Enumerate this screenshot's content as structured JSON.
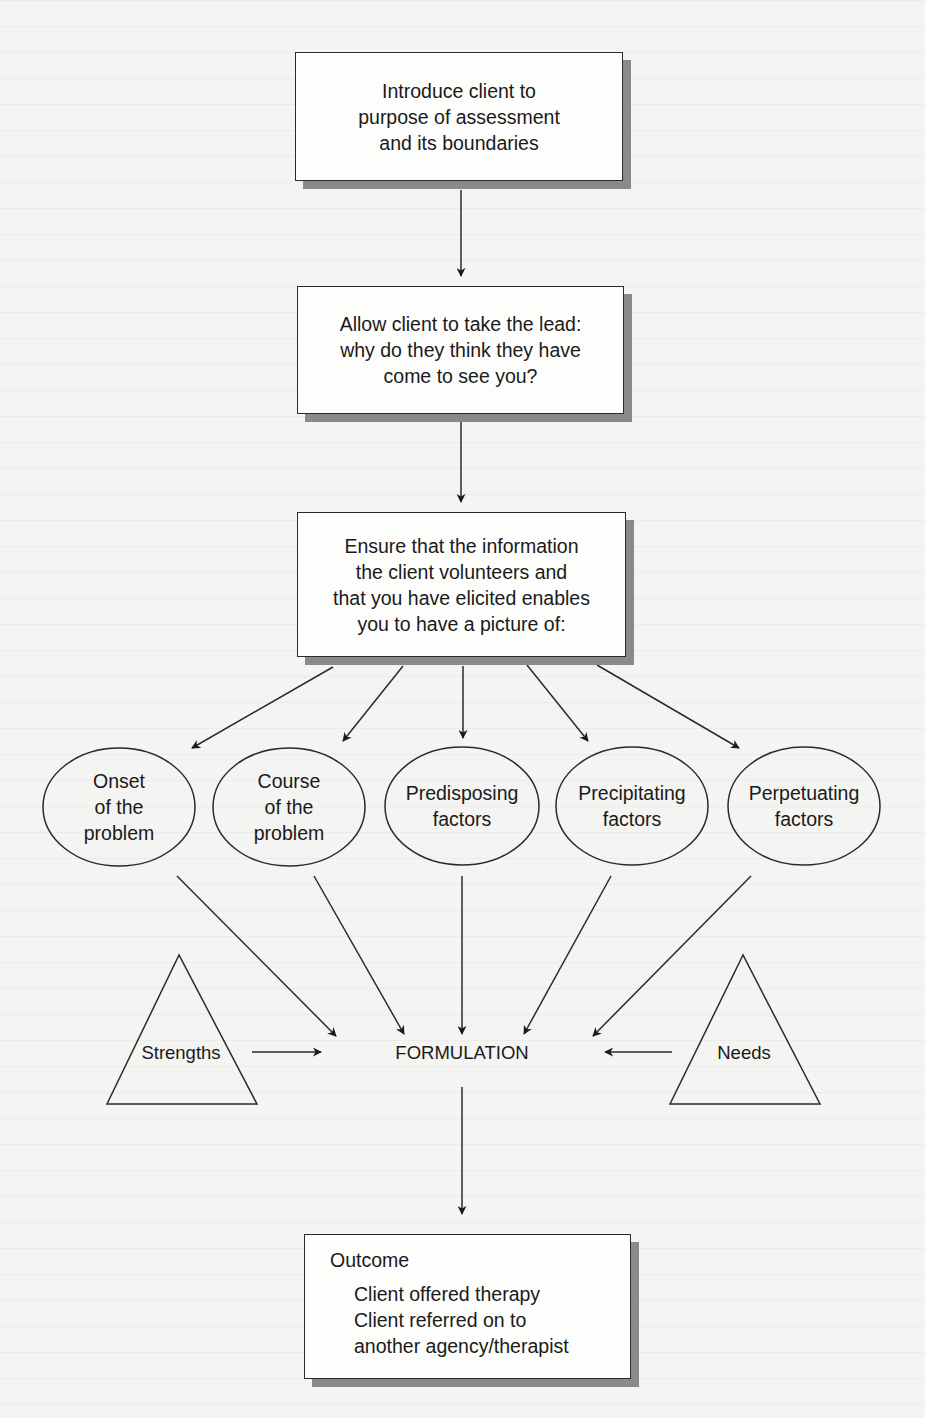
{
  "diagram": {
    "type": "flowchart",
    "colors": {
      "background": "#f4f4f2",
      "box_fill": "#fdfdfc",
      "stroke": "#2a2a2a",
      "shadow": "#8a8a8a"
    },
    "steps": [
      {
        "id": "introduce",
        "lines": [
          "Introduce client to",
          "purpose of assessment",
          "and its boundaries"
        ]
      },
      {
        "id": "take-lead",
        "lines": [
          "Allow client to take the lead:",
          "why do they think they have",
          "come to see you?"
        ]
      },
      {
        "id": "ensure-info",
        "lines": [
          "Ensure that the information",
          "the client volunteers and",
          "that you have elicited enables",
          "you to have a picture of:"
        ]
      }
    ],
    "factors": [
      {
        "id": "onset",
        "lines": [
          "Onset",
          "of the",
          "problem"
        ]
      },
      {
        "id": "course",
        "lines": [
          "Course",
          "of the",
          "problem"
        ]
      },
      {
        "id": "predisposing",
        "lines": [
          "Predisposing",
          "factors"
        ]
      },
      {
        "id": "precipitating",
        "lines": [
          "Precipitating",
          "factors"
        ]
      },
      {
        "id": "perpetuating",
        "lines": [
          "Perpetuating",
          "factors"
        ]
      }
    ],
    "side_inputs": [
      {
        "id": "strengths",
        "label": "Strengths"
      },
      {
        "id": "needs",
        "label": "Needs"
      }
    ],
    "formulation": {
      "label": "FORMULATION"
    },
    "outcome": {
      "heading": "Outcome",
      "items": [
        "Client offered therapy",
        "Client referred on to",
        "another agency/therapist"
      ]
    }
  }
}
